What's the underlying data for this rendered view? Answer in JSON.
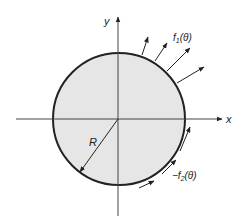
{
  "diagram": {
    "axes": {
      "x_label": "x",
      "y_label": "y"
    },
    "circle": {
      "center": [
        119,
        119
      ],
      "radius": 66,
      "fill": "#e6e6e6",
      "stroke": "#222222"
    },
    "radius_label": "R",
    "labels": {
      "f1": "f",
      "f1_sub": "1",
      "f1_arg": "(θ)",
      "f2_prefix": "−f",
      "f2_sub": "2",
      "f2_arg": "(θ)"
    },
    "normal_arrows": [
      {
        "from": [
          142,
          55
        ],
        "to": [
          148,
          37
        ]
      },
      {
        "from": [
          155,
          61
        ],
        "to": [
          167,
          43
        ]
      },
      {
        "from": [
          167,
          71
        ],
        "to": [
          190,
          48
        ]
      },
      {
        "from": [
          177,
          83
        ],
        "to": [
          204,
          67
        ]
      }
    ],
    "tangential_arrows": [
      {
        "from": [
          139,
          188
        ],
        "to": [
          154,
          181
        ]
      },
      {
        "from": [
          162,
          174
        ],
        "to": [
          176,
          160
        ]
      },
      {
        "from": [
          180,
          151
        ],
        "to": [
          190,
          127
        ]
      }
    ],
    "colors": {
      "line": "#222222",
      "axis": "#444444",
      "fill": "#e6e6e6"
    }
  }
}
